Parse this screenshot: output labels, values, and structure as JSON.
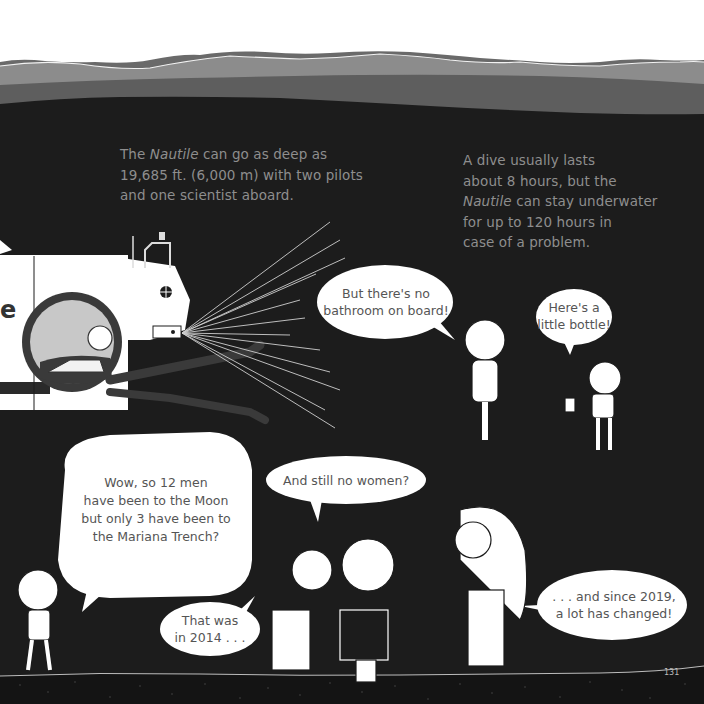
{
  "page_number": "131",
  "colors": {
    "sky": "#ffffff",
    "wave_light": "#8c8c8c",
    "wave_mid": "#5e5e5e",
    "deep_sea": "#1c1c1c",
    "caption_text": "#8e8e8e",
    "bubble_fill": "#ffffff",
    "bubble_text": "#555555"
  },
  "captions": {
    "left": {
      "pre": "The ",
      "italic": "Nautile",
      "post": " can go as deep as",
      "line2": "19,685 ft. (6,000 m) with two pilots",
      "line3": "and one scientist aboard."
    },
    "right": {
      "line1": "A dive usually lasts",
      "line2": "about 8 hours, but the",
      "line3_italic": "Nautile",
      "line3_post": " can stay underwater",
      "line4": "for up to 120 hours in",
      "line5": "case of a problem."
    }
  },
  "submarine": {
    "hull_letter": "e"
  },
  "bubbles": {
    "bathroom": {
      "line1": "But there's no",
      "line2": "bathroom on board!"
    },
    "bottle": {
      "line1": "Here's a",
      "line2": "little bottle!"
    },
    "moon": {
      "line1": "Wow, so 12 men",
      "line2": "have been to the Moon",
      "line3": "but only 3 have been to",
      "line4": "the Mariana Trench?"
    },
    "women": {
      "line1": "And still no women?"
    },
    "year2014": {
      "line1": "That was",
      "line2": "in 2014 . . ."
    },
    "year2019": {
      "line1": ". . . and since 2019,",
      "line2": "a lot has changed!"
    }
  }
}
